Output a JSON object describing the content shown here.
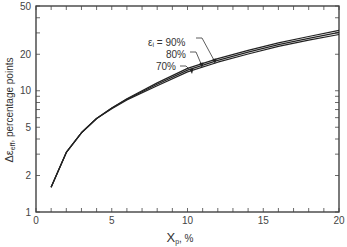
{
  "chart_data": {
    "type": "line",
    "title": "",
    "xlabel": "X_p, %",
    "ylabel": "Δε_eff, percentage points",
    "xlim": [
      0,
      20
    ],
    "ylim": [
      1,
      50
    ],
    "yscale": "log",
    "grid": false,
    "x_ticks": [
      "0",
      "5",
      "10",
      "15",
      "20"
    ],
    "y_ticks": [
      "1",
      "2",
      "5",
      "10",
      "20",
      "50"
    ],
    "annotation": "ε_i = 90%, 80%, 70%",
    "series": [
      {
        "name": "ε_i = 90%",
        "x": [
          1,
          2,
          3,
          4,
          5,
          6,
          8,
          10,
          12,
          14,
          16,
          18,
          20
        ],
        "y": [
          1.6,
          3.1,
          4.5,
          5.9,
          7.2,
          8.6,
          11.6,
          15.3,
          18.4,
          21.5,
          24.8,
          28.0,
          31.5
        ]
      },
      {
        "name": "ε_i = 80%",
        "x": [
          1,
          2,
          3,
          4,
          5,
          6,
          8,
          10,
          12,
          14,
          16,
          18,
          20
        ],
        "y": [
          1.6,
          3.1,
          4.5,
          5.9,
          7.2,
          8.5,
          11.3,
          14.8,
          17.8,
          20.8,
          24.0,
          27.0,
          30.3
        ]
      },
      {
        "name": "ε_i = 70%",
        "x": [
          1,
          2,
          3,
          4,
          5,
          6,
          8,
          10,
          12,
          14,
          16,
          18,
          20
        ],
        "y": [
          1.6,
          3.1,
          4.5,
          5.9,
          7.1,
          8.4,
          11.0,
          14.3,
          17.2,
          20.1,
          23.2,
          26.1,
          29.1
        ]
      }
    ]
  },
  "labels": {
    "xlabel_main": "X",
    "xlabel_sub": "p",
    "xlabel_suffix": ", %",
    "ylabel_main": "Δε",
    "ylabel_sub": "eff",
    "ylabel_suffix": ", percentage points",
    "annot_90": "εᵢ = 90%",
    "annot_80": "80%",
    "annot_70": "70%"
  }
}
